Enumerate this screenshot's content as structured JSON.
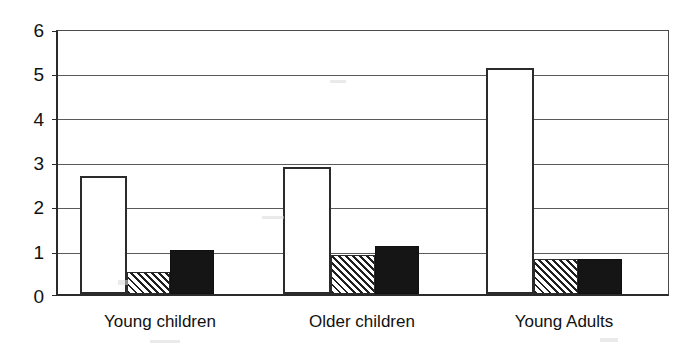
{
  "chart_data": {
    "type": "bar",
    "title": "",
    "subtitle": "",
    "xlabel": "",
    "ylabel": "",
    "categories": [
      "Young children",
      "Older children",
      "Young Adults"
    ],
    "series": [
      {
        "name": "white",
        "fill": "white",
        "values": [
          2.7,
          2.9,
          5.15
        ]
      },
      {
        "name": "hatched",
        "fill": "diagonal-hatch",
        "values": [
          0.5,
          0.9,
          0.8
        ]
      },
      {
        "name": "black",
        "fill": "black",
        "values": [
          1.0,
          1.1,
          0.8
        ]
      }
    ],
    "ylim": [
      0,
      6
    ],
    "yticks": [
      "0",
      "1",
      "2",
      "3",
      "4",
      "5",
      "6"
    ],
    "ytick_values": [
      0,
      1,
      2,
      3,
      4,
      5,
      6
    ],
    "grid": true,
    "grid_axis": "y",
    "legend": "none",
    "legend_position": "none",
    "annotations": [],
    "colors": {
      "axis": "#2b2b2b",
      "grid": "#5a5a5a",
      "bar_white": "#ffffff",
      "bar_black": "#151515",
      "bar_hatch_line": "#1f1f1f",
      "text": "#111111",
      "background": "#ffffff"
    }
  }
}
